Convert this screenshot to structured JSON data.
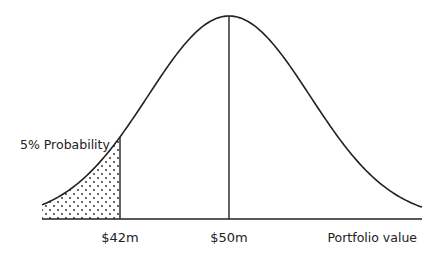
{
  "chart_data": {
    "type": "area",
    "title": "",
    "xlabel": "Portfolio value",
    "ylabel": "",
    "distribution": "normal",
    "mean": 50,
    "mean_label": "$50m",
    "threshold": 42,
    "threshold_label": "$42m",
    "tail_probability": 0.05,
    "annotation": "5% Probability",
    "shaded_region": "left tail below $42m (dotted pattern)",
    "x_ticks": [
      "$42m",
      "$50m"
    ],
    "grid": false,
    "legend": false
  },
  "colors": {
    "line": "#222222",
    "background": "#ffffff",
    "dots": "#222222"
  }
}
